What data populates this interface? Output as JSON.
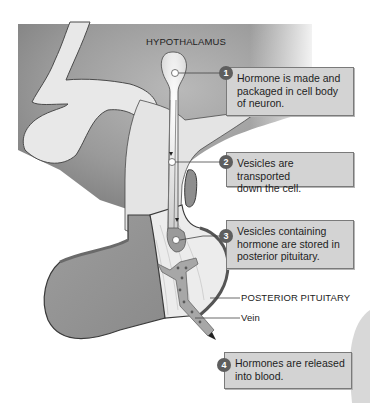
{
  "diagram": {
    "title_label": "HYPOTHALAMUS",
    "structure_labels": {
      "posterior_pituitary": "POSTERIOR PITUITARY",
      "vein": "Vein"
    },
    "steps": [
      {
        "number": "1",
        "text": "Hormone is made and\npackaged in cell body\nof neuron."
      },
      {
        "number": "2",
        "text": "Vesicles are transported\ndown the cell."
      },
      {
        "number": "3",
        "text": "Vesicles containing\nhormone are stored in\nposterior pituitary."
      },
      {
        "number": "4",
        "text": "Hormones are released\ninto blood."
      }
    ],
    "colors": {
      "background_gray": "#8f8f8f",
      "tissue_light": "#e6e6e6",
      "pituitary_mid": "#a3a3a3",
      "callout_fill": "#d3d3d3",
      "badge": "#5e5e5e",
      "outline": "#4a4a4a"
    }
  }
}
